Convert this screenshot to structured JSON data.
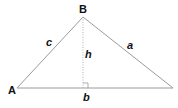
{
  "diagram": {
    "type": "triangle-with-altitude",
    "vertices": {
      "A": {
        "label": "A",
        "x": 17,
        "y": 88
      },
      "B": {
        "label": "B",
        "x": 83,
        "y": 17
      },
      "C": {
        "x": 173,
        "y": 88
      }
    },
    "sides": {
      "a": {
        "label": "a"
      },
      "b": {
        "label": "b"
      },
      "c": {
        "label": "c"
      }
    },
    "altitude": {
      "label": "h",
      "foot": {
        "x": 83,
        "y": 88
      },
      "style": "dotted"
    },
    "right_angle_marker": true,
    "colors": {
      "line": "#9a9a9a",
      "altitude": "#b0b0b0",
      "text": "#111111",
      "background": "#ffffff"
    }
  }
}
